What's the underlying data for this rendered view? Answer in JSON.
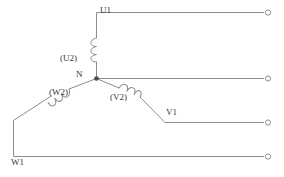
{
  "diagram": {
    "type": "electrical-schematic",
    "background_color": "#ffffff",
    "wire_color": "#8c8c8c",
    "label_color": "#3a3a3a",
    "labels": {
      "u1": "U1",
      "u2": "(U2)",
      "n": "N",
      "w2": "(W2)",
      "v2": "(V2)",
      "v1": "V1",
      "w1": "W1"
    },
    "terminals": [
      {
        "name": "terminal-u1",
        "x": 270,
        "y": 12
      },
      {
        "name": "terminal-n",
        "x": 270,
        "y": 78
      },
      {
        "name": "terminal-v1",
        "x": 270,
        "y": 122
      },
      {
        "name": "terminal-w1",
        "x": 270,
        "y": 156
      }
    ],
    "nodes": [
      {
        "name": "node-n",
        "x": 96,
        "y": 78
      }
    ],
    "windings": [
      {
        "name": "winding-u",
        "label": "(U2)",
        "orientation": "vertical",
        "loops": 3
      },
      {
        "name": "winding-w",
        "label": "(W2)",
        "orientation": "diagonal-left",
        "loops": 3
      },
      {
        "name": "winding-v",
        "label": "(V2)",
        "orientation": "diagonal-right",
        "loops": 3
      }
    ]
  }
}
